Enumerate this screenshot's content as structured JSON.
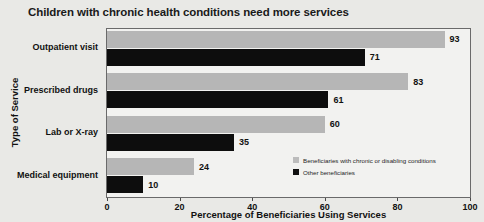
{
  "chart_data": {
    "type": "bar",
    "orientation": "horizontal",
    "title": "Children with chronic health conditions need more services",
    "xlabel": "Percentage of Beneficiaries Using Services",
    "ylabel": "Type of Service",
    "categories": [
      "Outpatient visit",
      "Prescribed drugs",
      "Lab or X-ray",
      "Medical equipment"
    ],
    "series": [
      {
        "name": "Beneficiaries with chronic or disabling conditions",
        "color": "#b6b6b6",
        "values": [
          93,
          83,
          60,
          24
        ]
      },
      {
        "name": "Other beneficiaries",
        "color": "#0d0d0d",
        "values": [
          71,
          61,
          35,
          10
        ]
      }
    ],
    "xlim": [
      0,
      100
    ],
    "xticks": [
      0,
      20,
      40,
      60,
      80,
      100
    ],
    "xtick_labels": [
      "0",
      "20",
      "40",
      "60",
      "80",
      "100"
    ],
    "grid": false,
    "legend_position": "inside-lower-right",
    "background_color": "#e9e9e6",
    "plot_background_color": "#f2f2f0"
  }
}
